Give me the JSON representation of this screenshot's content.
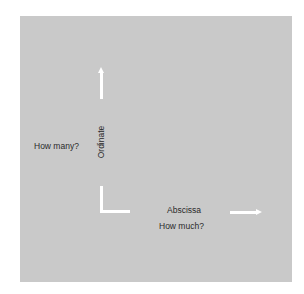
{
  "diagram": {
    "y_axis": {
      "name": "Ordinate",
      "question": "How many?"
    },
    "x_axis": {
      "name": "Abscissa",
      "question": "How much?"
    },
    "colors": {
      "background": "#ffffff",
      "panel": "#c9c9c9",
      "arrows": "#ffffff",
      "text": "#2a2a2a"
    },
    "icons": {
      "up_arrow": "arrow-up-icon",
      "right_arrow": "arrow-right-icon",
      "origin_corner": "axis-corner-icon"
    }
  }
}
